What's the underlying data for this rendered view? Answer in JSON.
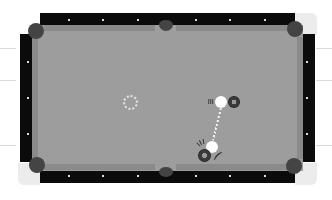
{
  "game": {
    "type": "billiards-pool",
    "view": "top-down",
    "colors": {
      "rail": "#0b0b0b",
      "cloth": "#9d9d9d",
      "cushion": "#8a8a8a",
      "pocket": "#444444",
      "diamond": "#dcdcdc",
      "cue_ball": "#ffffff",
      "object_ball": "#3a3a3a",
      "aim_line": "#f2f2f2"
    },
    "table": {
      "pockets": [
        {
          "id": "top-left"
        },
        {
          "id": "top-middle"
        },
        {
          "id": "top-right"
        },
        {
          "id": "bottom-left"
        },
        {
          "id": "bottom-middle"
        },
        {
          "id": "bottom-right"
        }
      ],
      "diamonds_per_long_rail_half": 3,
      "diamonds_per_short_rail": 2
    },
    "balls": {
      "cue_ball": {
        "label": "cue ball",
        "x": 221,
        "y": 102
      },
      "target_ball": {
        "label": "object ball",
        "x": 234,
        "y": 102
      },
      "ghost_cue": {
        "label": "ghost cue ball",
        "x": 212,
        "y": 148
      },
      "second_ball": {
        "label": "object ball (collision)",
        "x": 205,
        "y": 156
      },
      "spot_marker": {
        "label": "aim spot",
        "x": 130,
        "y": 103
      }
    },
    "indicators": {
      "cue_stick_tip": "cue-stick-tip",
      "aim_line": "dashed-aim-line",
      "collision_sparks": "impact-marks"
    }
  }
}
